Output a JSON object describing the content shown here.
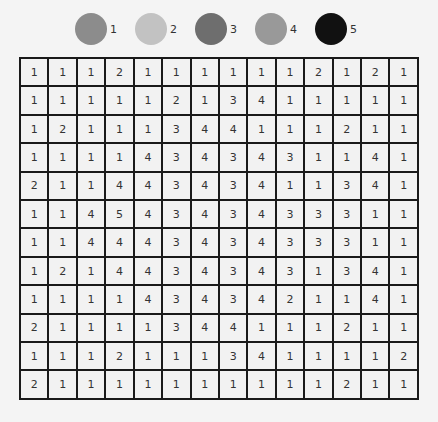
{
  "legend": [
    {
      "label": "1",
      "color": "#8c8c8c"
    },
    {
      "label": "2",
      "color": "#c2c2c2"
    },
    {
      "label": "3",
      "color": "#6e6e6e"
    },
    {
      "label": "4",
      "color": "#999999"
    },
    {
      "label": "5",
      "color": "#111111"
    }
  ],
  "grid": {
    "rows": [
      [
        1,
        1,
        1,
        2,
        1,
        1,
        1,
        1,
        1,
        1,
        2,
        1,
        2,
        1
      ],
      [
        1,
        1,
        1,
        1,
        1,
        2,
        1,
        3,
        4,
        1,
        1,
        1,
        1,
        1
      ],
      [
        1,
        2,
        1,
        1,
        1,
        3,
        4,
        4,
        1,
        1,
        1,
        2,
        1,
        1
      ],
      [
        1,
        1,
        1,
        1,
        4,
        3,
        4,
        3,
        4,
        3,
        1,
        1,
        4,
        1
      ],
      [
        2,
        1,
        1,
        4,
        4,
        3,
        4,
        3,
        4,
        1,
        1,
        3,
        4,
        1
      ],
      [
        1,
        1,
        4,
        5,
        4,
        3,
        4,
        3,
        4,
        3,
        3,
        3,
        1,
        1
      ],
      [
        1,
        1,
        4,
        4,
        4,
        3,
        4,
        3,
        4,
        3,
        3,
        3,
        1,
        1
      ],
      [
        1,
        2,
        1,
        4,
        4,
        3,
        4,
        3,
        4,
        3,
        1,
        3,
        4,
        1
      ],
      [
        1,
        1,
        1,
        1,
        4,
        3,
        4,
        3,
        4,
        2,
        1,
        1,
        4,
        1
      ],
      [
        2,
        1,
        1,
        1,
        1,
        3,
        4,
        4,
        1,
        1,
        1,
        2,
        1,
        1
      ],
      [
        1,
        1,
        1,
        2,
        1,
        1,
        1,
        3,
        4,
        1,
        1,
        1,
        1,
        2
      ],
      [
        2,
        1,
        1,
        1,
        1,
        1,
        1,
        1,
        1,
        1,
        1,
        2,
        1,
        1
      ]
    ]
  }
}
